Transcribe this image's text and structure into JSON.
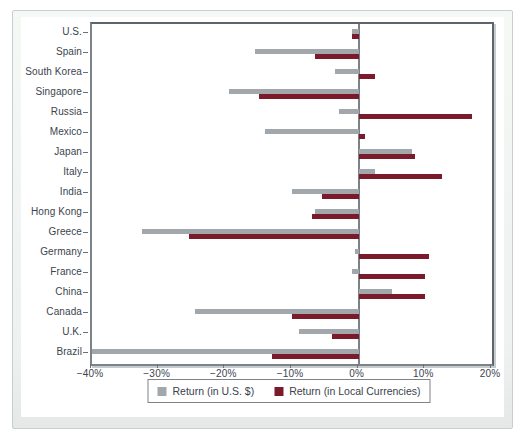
{
  "chart_data": {
    "type": "bar",
    "orientation": "horizontal",
    "title": "",
    "xlabel": "",
    "ylabel": "",
    "categories": [
      "U.S.",
      "Spain",
      "South Korea",
      "Singapore",
      "Russia",
      "Mexico",
      "Japan",
      "Italy",
      "India",
      "Hong Kong",
      "Greece",
      "Germany",
      "France",
      "China",
      "Canada",
      "U.K.",
      "Brazil"
    ],
    "series": [
      {
        "name": "Return (in U.S. $)",
        "color": "#a2a7ab",
        "values": [
          -1,
          -15.5,
          -3.5,
          -19.5,
          -3,
          -14,
          8,
          2.5,
          -10,
          -6.5,
          -32.5,
          -0.5,
          -1,
          5,
          -24.5,
          -9,
          -40
        ]
      },
      {
        "name": "Return (in Local Currencies)",
        "color": "#7b1a2b",
        "values": [
          -1,
          -6.5,
          2.5,
          -15,
          17,
          1,
          8.5,
          12.5,
          -5.5,
          -7,
          -25.5,
          10.5,
          10,
          10,
          -10,
          -4,
          -13
        ]
      }
    ],
    "xlim": [
      -40,
      20
    ],
    "x_tick_values": [
      -40,
      -30,
      -20,
      -10,
      0,
      10,
      20
    ],
    "x_tick_labels": [
      "−40%",
      "−30%",
      "−20%",
      "−10%",
      "0%",
      "10%",
      "20%"
    ],
    "grid": false,
    "legend_position": "bottom"
  },
  "colors": {
    "usd_bar": "#a2a7ab",
    "local_bar": "#7b1a2b",
    "axis": "#6a7177",
    "text": "#3b444e",
    "panel_border": "#c8cfd0"
  }
}
